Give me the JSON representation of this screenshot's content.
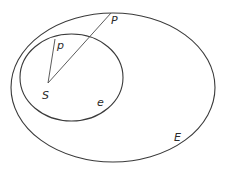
{
  "diagram": {
    "colors": {
      "stroke": "#3a3a3a",
      "text": "#2a2a2a",
      "background": "#ffffff"
    },
    "outer_ellipse": {
      "label": "E",
      "cx": 113,
      "cy": 87.5,
      "rx": 102,
      "ry": 74.5
    },
    "inner_ellipse": {
      "label": "e",
      "cx": 71.5,
      "cy": 77.5,
      "rx": 51.5,
      "ry": 43.5
    },
    "focus": {
      "label": "S",
      "x": 48,
      "y": 83
    },
    "point_inner": {
      "label": "p",
      "x": 55,
      "y": 39
    },
    "point_outer": {
      "label": "P",
      "x": 111,
      "y": 13
    }
  }
}
